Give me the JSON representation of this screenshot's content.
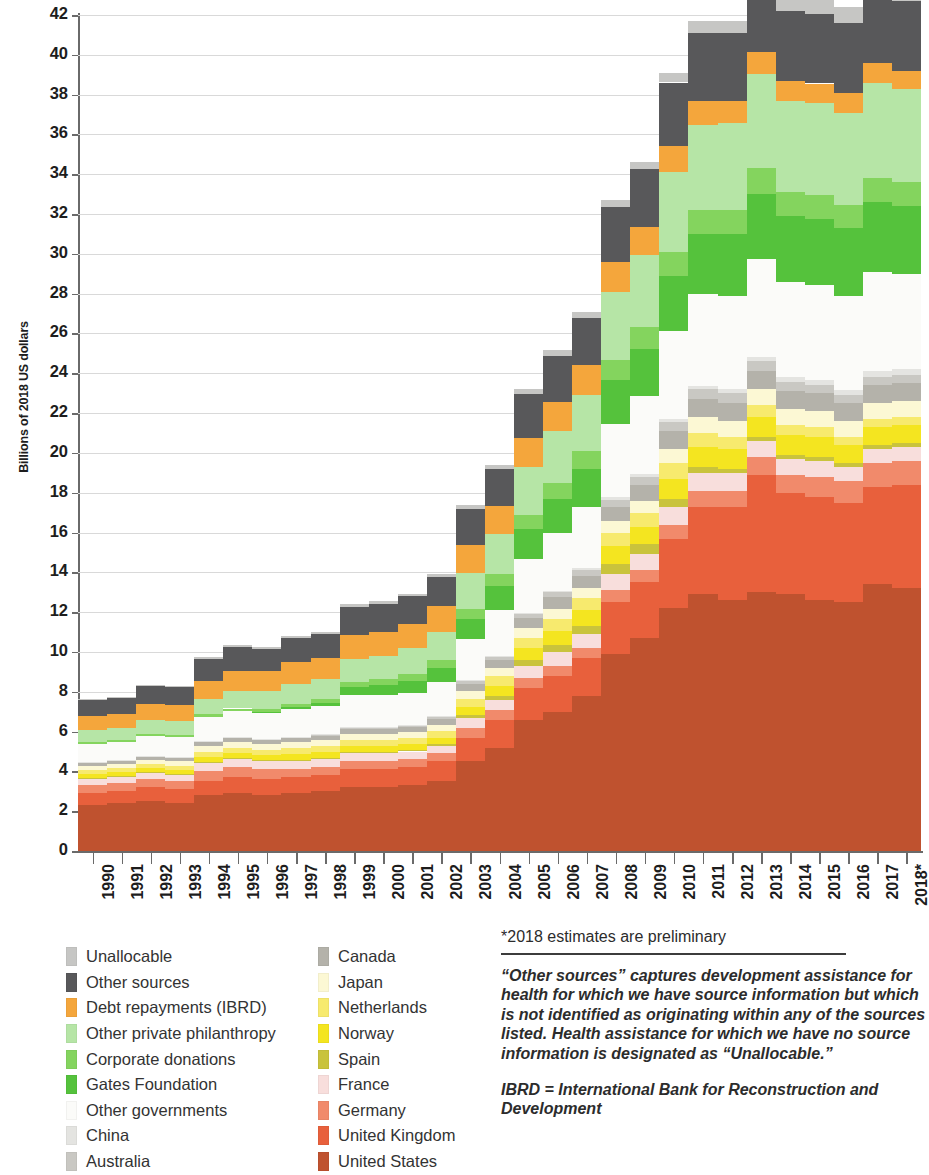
{
  "axes": {
    "ylabel": "Billions of 2018 US dollars",
    "yticks": [
      0,
      2,
      4,
      6,
      8,
      10,
      12,
      14,
      16,
      18,
      20,
      22,
      24,
      26,
      28,
      30,
      32,
      34,
      36,
      38,
      40,
      42
    ]
  },
  "notes": {
    "footnote": "*2018 estimates are preliminary",
    "para1": "“Other sources” captures development assistance for health for which we have source information but which is not identified as originating within any of the sources listed. Health assistance for which we have no source information is designated as “Unallocable.”",
    "para2": "IBRD = International Bank for Reconstruction and Development"
  },
  "legend": {
    "column1": [
      {
        "label": "Unallocable",
        "color": "#c6c6c4"
      },
      {
        "label": "Other sources",
        "color": "#58585a"
      },
      {
        "label": "Debt repayments (IBRD)",
        "color": "#f4a63c"
      },
      {
        "label": "Other private philanthropy",
        "color": "#b6e5a6"
      },
      {
        "label": "Corporate donations",
        "color": "#84d45e"
      },
      {
        "label": "Gates Foundation",
        "color": "#55c23c"
      },
      {
        "label": "Other governments",
        "color": "#fbfbf9"
      },
      {
        "label": "China",
        "color": "#e4e4e1"
      },
      {
        "label": "Australia",
        "color": "#c9c8c3"
      }
    ],
    "column2": [
      {
        "label": "Canada",
        "color": "#b4b2aa"
      },
      {
        "label": "Japan",
        "color": "#fcf8d4"
      },
      {
        "label": "Netherlands",
        "color": "#f7ea6e"
      },
      {
        "label": "Norway",
        "color": "#f4e520"
      },
      {
        "label": "Spain",
        "color": "#c9c33c"
      },
      {
        "label": "France",
        "color": "#f8dedc"
      },
      {
        "label": "Germany",
        "color": "#f18a6b"
      },
      {
        "label": "United Kingdom",
        "color": "#e8603c"
      },
      {
        "label": "United States",
        "color": "#bf522f"
      }
    ]
  },
  "chart_data": {
    "type": "area",
    "title": "",
    "xlabel": "",
    "ylabel": "Billions of 2018 US dollars",
    "ylim": [
      0,
      42
    ],
    "grid": true,
    "legend_position": "below",
    "x": [
      "1990",
      "1991",
      "1992",
      "1993",
      "1994",
      "1995",
      "1996",
      "1997",
      "1998",
      "1999",
      "2000",
      "2001",
      "2002",
      "2003",
      "2004",
      "2005",
      "2006",
      "2007",
      "2008",
      "2009",
      "2010",
      "2011",
      "2012",
      "2013",
      "2014",
      "2015",
      "2016",
      "2017",
      "2018*"
    ],
    "totals": [
      7.6,
      7.7,
      8.3,
      8.4,
      9.8,
      10.5,
      10.3,
      11.2,
      11.3,
      12.7,
      12.6,
      12.8,
      13.6,
      16.8,
      18.3,
      21.4,
      22.9,
      24.4,
      29.6,
      31.2,
      35.0,
      37.2,
      37.5,
      39.7,
      38.8,
      38.8,
      38.5,
      40.3,
      39.1
    ],
    "series": [
      {
        "name": "United States",
        "color": "#bf522f",
        "values": [
          2.3,
          2.4,
          2.5,
          2.4,
          2.8,
          2.9,
          2.8,
          2.9,
          3.0,
          3.2,
          3.2,
          3.3,
          3.5,
          4.5,
          5.2,
          6.6,
          7.0,
          7.8,
          9.9,
          10.7,
          12.2,
          12.9,
          12.6,
          13.0,
          12.9,
          12.6,
          12.5,
          13.4,
          13.2
        ]
      },
      {
        "name": "United Kingdom",
        "color": "#e8603c",
        "values": [
          0.6,
          0.6,
          0.7,
          0.7,
          0.7,
          0.8,
          0.8,
          0.8,
          0.8,
          0.9,
          0.9,
          0.9,
          1.0,
          1.2,
          1.4,
          1.6,
          1.8,
          1.9,
          2.6,
          2.8,
          3.5,
          4.4,
          4.7,
          5.9,
          5.1,
          5.2,
          5.0,
          4.9,
          5.2
        ]
      },
      {
        "name": "Germany",
        "color": "#f18a6b",
        "values": [
          0.4,
          0.4,
          0.4,
          0.4,
          0.5,
          0.5,
          0.5,
          0.4,
          0.4,
          0.4,
          0.4,
          0.4,
          0.4,
          0.5,
          0.5,
          0.5,
          0.5,
          0.5,
          0.6,
          0.6,
          0.7,
          0.8,
          0.8,
          0.9,
          0.9,
          1.0,
          1.1,
          1.2,
          1.2
        ]
      },
      {
        "name": "France",
        "color": "#f8dedc",
        "values": [
          0.3,
          0.3,
          0.3,
          0.3,
          0.4,
          0.4,
          0.4,
          0.4,
          0.4,
          0.4,
          0.4,
          0.4,
          0.4,
          0.5,
          0.5,
          0.6,
          0.7,
          0.7,
          0.8,
          0.8,
          0.9,
          0.9,
          0.9,
          0.8,
          0.8,
          0.8,
          0.7,
          0.7,
          0.7
        ]
      },
      {
        "name": "Spain",
        "color": "#c9c33c",
        "values": [
          0.05,
          0.05,
          0.05,
          0.05,
          0.06,
          0.06,
          0.06,
          0.06,
          0.07,
          0.07,
          0.07,
          0.08,
          0.1,
          0.15,
          0.2,
          0.3,
          0.35,
          0.4,
          0.5,
          0.5,
          0.4,
          0.3,
          0.2,
          0.2,
          0.2,
          0.2,
          0.2,
          0.2,
          0.2
        ]
      },
      {
        "name": "Norway",
        "color": "#f4e520",
        "values": [
          0.2,
          0.2,
          0.2,
          0.2,
          0.25,
          0.25,
          0.25,
          0.3,
          0.3,
          0.3,
          0.3,
          0.3,
          0.3,
          0.4,
          0.5,
          0.6,
          0.7,
          0.8,
          0.9,
          0.9,
          1.0,
          1.0,
          1.0,
          1.0,
          1.0,
          1.0,
          0.9,
          0.9,
          0.9
        ]
      },
      {
        "name": "Netherlands",
        "color": "#f7ea6e",
        "values": [
          0.2,
          0.2,
          0.2,
          0.2,
          0.25,
          0.25,
          0.25,
          0.3,
          0.3,
          0.3,
          0.3,
          0.3,
          0.35,
          0.4,
          0.5,
          0.5,
          0.6,
          0.6,
          0.7,
          0.7,
          0.8,
          0.7,
          0.6,
          0.6,
          0.5,
          0.5,
          0.4,
          0.4,
          0.4
        ]
      },
      {
        "name": "Japan",
        "color": "#fcf8d4",
        "values": [
          0.2,
          0.2,
          0.2,
          0.25,
          0.3,
          0.3,
          0.3,
          0.3,
          0.3,
          0.3,
          0.3,
          0.3,
          0.3,
          0.4,
          0.4,
          0.5,
          0.5,
          0.5,
          0.6,
          0.6,
          0.7,
          0.8,
          0.8,
          0.8,
          0.8,
          0.8,
          0.8,
          0.8,
          0.8
        ]
      },
      {
        "name": "Canada",
        "color": "#b4b2aa",
        "values": [
          0.15,
          0.15,
          0.15,
          0.15,
          0.2,
          0.2,
          0.2,
          0.2,
          0.2,
          0.25,
          0.25,
          0.25,
          0.3,
          0.35,
          0.4,
          0.5,
          0.6,
          0.6,
          0.7,
          0.8,
          0.9,
          0.9,
          0.9,
          0.9,
          0.9,
          0.9,
          0.9,
          0.9,
          0.9
        ]
      },
      {
        "name": "Australia",
        "color": "#c9c8c3",
        "values": [
          0.05,
          0.05,
          0.05,
          0.05,
          0.06,
          0.06,
          0.06,
          0.06,
          0.07,
          0.07,
          0.07,
          0.08,
          0.1,
          0.12,
          0.15,
          0.2,
          0.25,
          0.3,
          0.35,
          0.4,
          0.45,
          0.5,
          0.5,
          0.5,
          0.45,
          0.4,
          0.4,
          0.4,
          0.4
        ]
      },
      {
        "name": "China",
        "color": "#e4e4e1",
        "values": [
          0.02,
          0.02,
          0.02,
          0.02,
          0.02,
          0.02,
          0.02,
          0.02,
          0.03,
          0.03,
          0.03,
          0.03,
          0.04,
          0.05,
          0.06,
          0.07,
          0.08,
          0.1,
          0.12,
          0.14,
          0.16,
          0.18,
          0.2,
          0.22,
          0.24,
          0.26,
          0.28,
          0.3,
          0.3
        ]
      },
      {
        "name": "Other governments",
        "color": "#fbfbf9",
        "values": [
          0.9,
          0.9,
          1.0,
          1.0,
          1.2,
          1.3,
          1.3,
          1.4,
          1.4,
          1.6,
          1.6,
          1.6,
          1.7,
          2.1,
          2.3,
          2.7,
          2.9,
          3.1,
          3.7,
          3.9,
          4.4,
          4.6,
          4.7,
          4.9,
          4.8,
          4.8,
          4.7,
          5.0,
          4.8
        ]
      },
      {
        "name": "Gates Foundation",
        "color": "#55c23c",
        "values": [
          0.0,
          0.0,
          0.0,
          0.0,
          0.0,
          0.0,
          0.05,
          0.1,
          0.15,
          0.4,
          0.5,
          0.6,
          0.7,
          1.0,
          1.2,
          1.5,
          1.7,
          1.9,
          2.2,
          2.4,
          2.8,
          3.0,
          3.1,
          3.3,
          3.3,
          3.3,
          3.4,
          3.5,
          3.4
        ]
      },
      {
        "name": "Corporate donations",
        "color": "#84d45e",
        "values": [
          0.1,
          0.1,
          0.1,
          0.1,
          0.12,
          0.12,
          0.15,
          0.15,
          0.2,
          0.25,
          0.3,
          0.35,
          0.4,
          0.5,
          0.6,
          0.7,
          0.8,
          0.9,
          1.0,
          1.1,
          1.2,
          1.2,
          1.2,
          1.3,
          1.2,
          1.2,
          1.2,
          1.2,
          1.2
        ]
      },
      {
        "name": "Other private philanthropy",
        "color": "#b6e5a6",
        "values": [
          0.6,
          0.6,
          0.7,
          0.7,
          0.8,
          0.9,
          0.9,
          1.0,
          1.0,
          1.2,
          1.2,
          1.3,
          1.4,
          1.8,
          2.0,
          2.4,
          2.6,
          2.8,
          3.4,
          3.6,
          4.0,
          4.3,
          4.4,
          4.7,
          4.6,
          4.6,
          4.6,
          4.8,
          4.7
        ]
      },
      {
        "name": "Debt repayments (IBRD)",
        "color": "#f4a63c",
        "values": [
          0.7,
          0.7,
          0.8,
          0.8,
          0.9,
          1.0,
          1.0,
          1.1,
          1.1,
          1.2,
          1.2,
          1.2,
          1.3,
          1.4,
          1.4,
          1.5,
          1.5,
          1.5,
          1.5,
          1.4,
          1.3,
          1.2,
          1.1,
          1.1,
          1.0,
          1.0,
          1.0,
          1.0,
          0.9
        ]
      },
      {
        "name": "Other sources",
        "color": "#58585a",
        "values": [
          0.8,
          0.8,
          0.9,
          0.9,
          1.1,
          1.2,
          1.1,
          1.2,
          1.2,
          1.4,
          1.4,
          1.4,
          1.5,
          1.8,
          1.9,
          2.2,
          2.3,
          2.4,
          2.8,
          2.9,
          3.2,
          3.4,
          3.4,
          3.6,
          3.5,
          3.5,
          3.5,
          3.7,
          3.5
        ]
      },
      {
        "name": "Unallocable",
        "color": "#c6c6c4",
        "values": [
          0.08,
          0.08,
          0.08,
          0.08,
          0.1,
          0.1,
          0.1,
          0.1,
          0.1,
          0.12,
          0.12,
          0.12,
          0.15,
          0.2,
          0.2,
          0.25,
          0.3,
          0.3,
          0.35,
          0.4,
          0.5,
          0.6,
          0.6,
          0.7,
          0.7,
          0.8,
          0.8,
          1.0,
          0.9
        ]
      }
    ]
  }
}
